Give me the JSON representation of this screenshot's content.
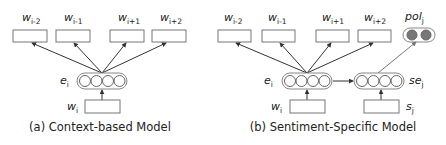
{
  "figure": {
    "panel_a": {
      "caption": "(a) Context-based Model",
      "context_words": [
        {
          "base": "w",
          "sub": "i-2"
        },
        {
          "base": "w",
          "sub": "i-1"
        },
        {
          "base": "w",
          "sub": "i+1"
        },
        {
          "base": "w",
          "sub": "i+2"
        }
      ],
      "embedding": {
        "base": "e",
        "sub": "i"
      },
      "input_word": {
        "base": "w",
        "sub": "i"
      }
    },
    "panel_b": {
      "caption": "(b) Sentiment-Specific Model",
      "context_words": [
        {
          "base": "w",
          "sub": "i-2"
        },
        {
          "base": "w",
          "sub": "i-1"
        },
        {
          "base": "w",
          "sub": "i+1"
        },
        {
          "base": "w",
          "sub": "i+2"
        }
      ],
      "polarity": {
        "base": "pol",
        "sub": "j"
      },
      "embedding": {
        "base": "e",
        "sub": "i"
      },
      "sentiment_embedding": {
        "base": "se",
        "sub": "j"
      },
      "input_word": {
        "base": "w",
        "sub": "i"
      },
      "sentiment_input": {
        "base": "s",
        "sub": "j"
      }
    }
  }
}
